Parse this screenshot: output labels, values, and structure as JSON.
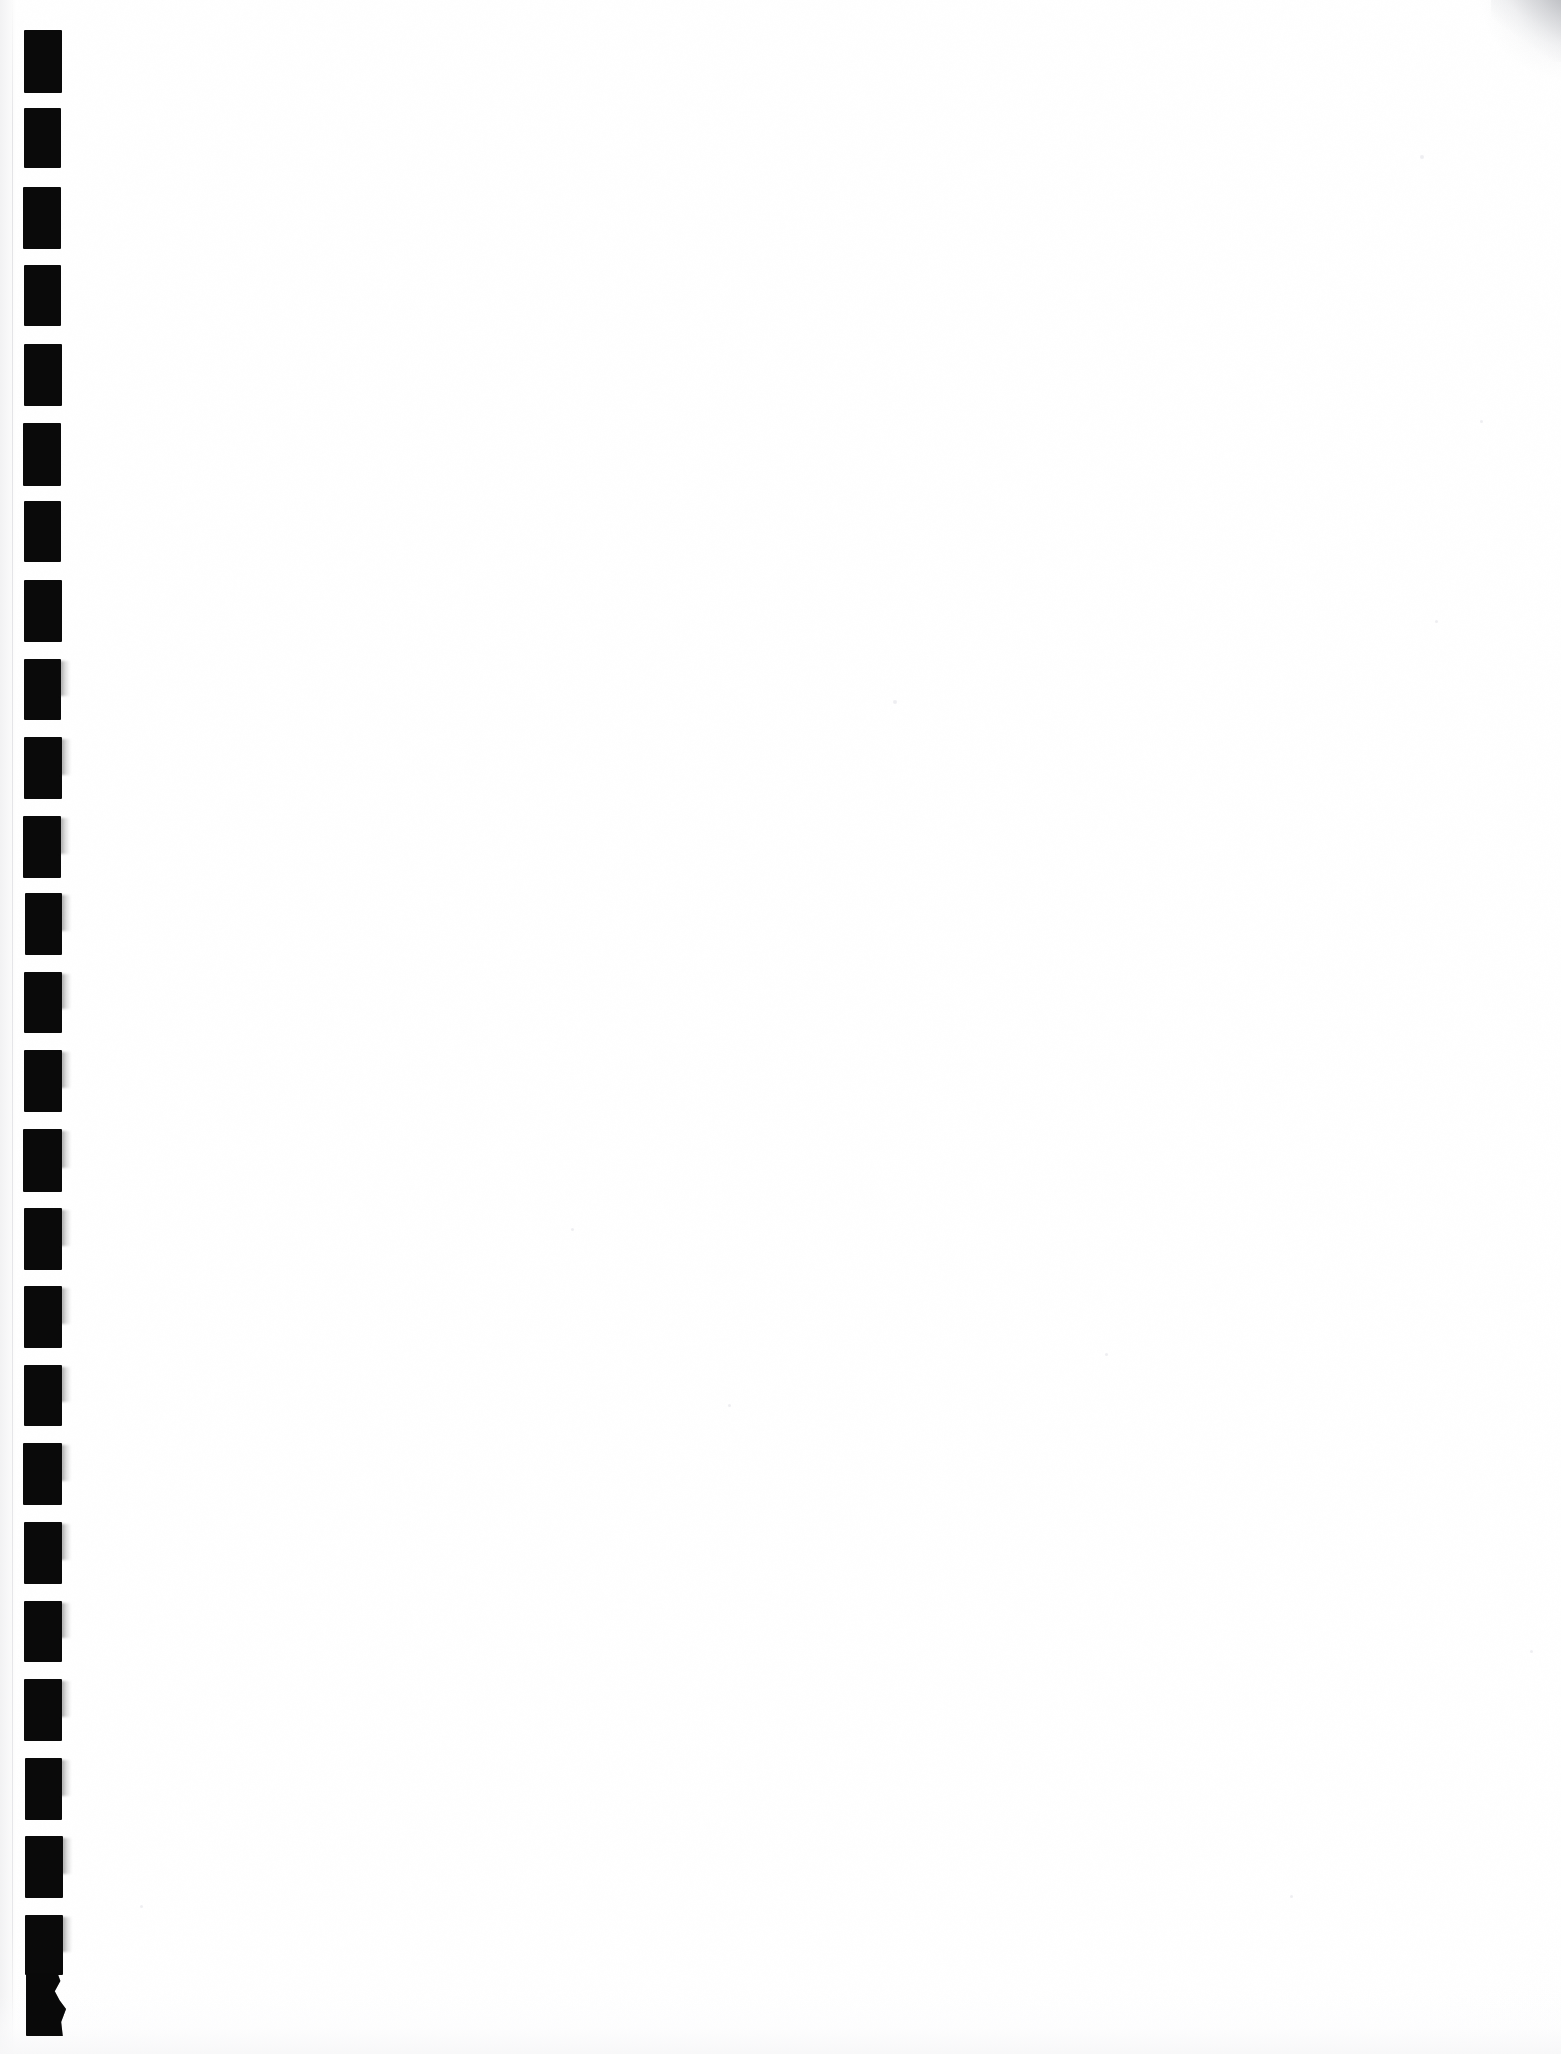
{
  "document": {
    "kind": "scanned-page",
    "title": "Scanned blank notebook page",
    "page_background_color": "#ffffff",
    "ink_color": "#0a0a0a",
    "edge_shadow_color": "#f2f2f3",
    "width_px": 1561,
    "height_px": 2054,
    "visible_text": "",
    "body_note": ""
  },
  "binding": {
    "name": "comb-binding-punch-marks",
    "marks_icon": "punch-hole-icon",
    "count": 26,
    "first_mark_top_px": 30,
    "pitch_px": 78.5,
    "mark_left_px": 24,
    "mark_width_px": 38,
    "mark_height_px": 63,
    "color": "#0a0a0a",
    "marks": [
      {
        "index": 1,
        "top": 30,
        "left": 24,
        "width": 38,
        "height": 63
      },
      {
        "index": 2,
        "top": 108,
        "left": 24,
        "width": 37,
        "height": 60
      },
      {
        "index": 3,
        "top": 187,
        "left": 23,
        "width": 38,
        "height": 62
      },
      {
        "index": 4,
        "top": 265,
        "left": 24,
        "width": 37,
        "height": 61
      },
      {
        "index": 5,
        "top": 344,
        "left": 24,
        "width": 38,
        "height": 62
      },
      {
        "index": 6,
        "top": 423,
        "left": 23,
        "width": 38,
        "height": 63
      },
      {
        "index": 7,
        "top": 501,
        "left": 24,
        "width": 37,
        "height": 61
      },
      {
        "index": 8,
        "top": 580,
        "left": 24,
        "width": 38,
        "height": 62
      },
      {
        "index": 9,
        "top": 659,
        "left": 24,
        "width": 37,
        "height": 61
      },
      {
        "index": 10,
        "top": 737,
        "left": 24,
        "width": 38,
        "height": 62
      },
      {
        "index": 11,
        "top": 816,
        "left": 23,
        "width": 38,
        "height": 62
      },
      {
        "index": 12,
        "top": 893,
        "left": 25,
        "width": 37,
        "height": 62
      },
      {
        "index": 13,
        "top": 972,
        "left": 24,
        "width": 38,
        "height": 61
      },
      {
        "index": 14,
        "top": 1050,
        "left": 24,
        "width": 38,
        "height": 62
      },
      {
        "index": 15,
        "top": 1129,
        "left": 23,
        "width": 39,
        "height": 63
      },
      {
        "index": 16,
        "top": 1208,
        "left": 24,
        "width": 38,
        "height": 62
      },
      {
        "index": 17,
        "top": 1286,
        "left": 24,
        "width": 38,
        "height": 62
      },
      {
        "index": 18,
        "top": 1365,
        "left": 24,
        "width": 38,
        "height": 61
      },
      {
        "index": 19,
        "top": 1443,
        "left": 23,
        "width": 39,
        "height": 62
      },
      {
        "index": 20,
        "top": 1522,
        "left": 24,
        "width": 38,
        "height": 62
      },
      {
        "index": 21,
        "top": 1601,
        "left": 24,
        "width": 38,
        "height": 61
      },
      {
        "index": 22,
        "top": 1679,
        "left": 24,
        "width": 38,
        "height": 62
      },
      {
        "index": 23,
        "top": 1758,
        "left": 25,
        "width": 37,
        "height": 62
      },
      {
        "index": 24,
        "top": 1836,
        "left": 25,
        "width": 38,
        "height": 62
      },
      {
        "index": 25,
        "top": 1915,
        "left": 25,
        "width": 38,
        "height": 60
      },
      {
        "index": 26,
        "top": 1972,
        "left": 26,
        "width": 40,
        "height": 64
      }
    ]
  },
  "artifacts": {
    "left_edge": {
      "name": "sheet-left-edge",
      "color": "#f2f2f3"
    },
    "corner_curl": {
      "name": "top-right-corner-curl-shadow",
      "color": "#9698 9e"
    },
    "bottom_edge": {
      "name": "sheet-bottom-edge",
      "color": "#f7f7f8"
    },
    "specks": [
      {
        "x": 893,
        "y": 700,
        "size": 4
      },
      {
        "x": 571,
        "y": 1228,
        "size": 3
      },
      {
        "x": 728,
        "y": 1404,
        "size": 3
      },
      {
        "x": 1105,
        "y": 1353,
        "size": 3
      },
      {
        "x": 1290,
        "y": 1895,
        "size": 3
      },
      {
        "x": 1420,
        "y": 155,
        "size": 4
      },
      {
        "x": 1480,
        "y": 420,
        "size": 3
      },
      {
        "x": 1435,
        "y": 620,
        "size": 3
      },
      {
        "x": 140,
        "y": 1905,
        "size": 3
      },
      {
        "x": 1530,
        "y": 1650,
        "size": 3
      }
    ]
  }
}
